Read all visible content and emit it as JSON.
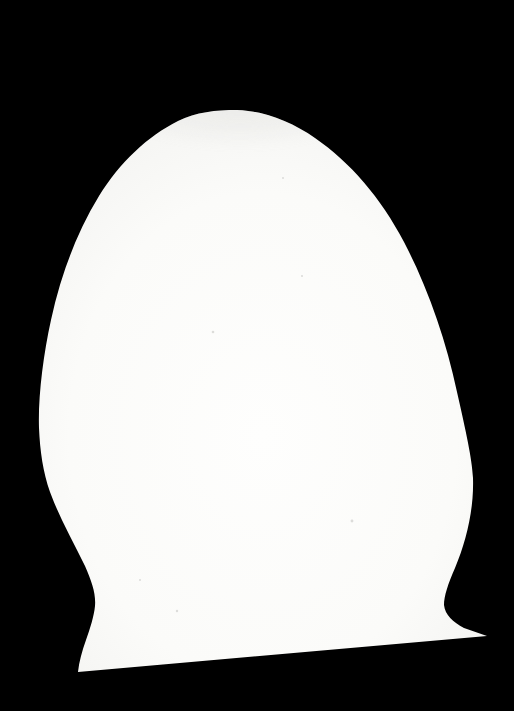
{
  "scene": {
    "description": "Black-and-white photograph: glossy white egg-shaped object with a narrowed neck and flared skirt base, silhouetted against a pure black background; bottom edge slopes slightly upward to the right",
    "background_color": "#000000",
    "silhouette": {
      "path": "M 237 110 C 265 111 292 122 315 138 C 350 162 381 198 404 242 C 428 288 446 340 457 392 C 466 432 472 458 473 478 C 474 510 466 542 455 568 C 448 584 444 596 444 605 C 445 615 453 622 464 628 L 487 636 L 78 672 C 79 662 82 651 86 640 C 90 629 94 616 95 606 C 96 594 92 582 85 566 C 73 541 59 517 50 492 C 43 472 40 451 39 428 C 38 398 43 356 51 320 C 61 274 77 232 99 196 C 120 162 148 136 178 121 C 196 112 216 110 237 110 Z",
      "fill_center": "#fefefd",
      "fill_mid": "#fbfbf9",
      "fill_outer": "#f4f4f2",
      "fill_edge": "#e7e7e4",
      "apex_shade_color": "#d8d8d5",
      "apex_shade_opacity": "0.38"
    },
    "speck_color": "#d2d2cf",
    "specks": [
      {
        "x": 213,
        "y": 332,
        "r": 1.3
      },
      {
        "x": 302,
        "y": 276,
        "r": 1.1
      },
      {
        "x": 352,
        "y": 521,
        "r": 1.4
      },
      {
        "x": 177,
        "y": 611,
        "r": 1.2
      },
      {
        "x": 283,
        "y": 178,
        "r": 1.0
      },
      {
        "x": 140,
        "y": 580,
        "r": 1.0
      }
    ],
    "geometry": {
      "apex": {
        "x": 237,
        "y": 110
      },
      "leftmost": {
        "x": 39,
        "y": 428
      },
      "rightmost": {
        "x": 473,
        "y": 478
      },
      "left_waist": {
        "x": 95,
        "y": 606
      },
      "right_waist": {
        "x": 444,
        "y": 600
      },
      "bottom_left_tip": {
        "x": 78,
        "y": 672
      },
      "bottom_right_tip": {
        "x": 487,
        "y": 636
      }
    }
  }
}
